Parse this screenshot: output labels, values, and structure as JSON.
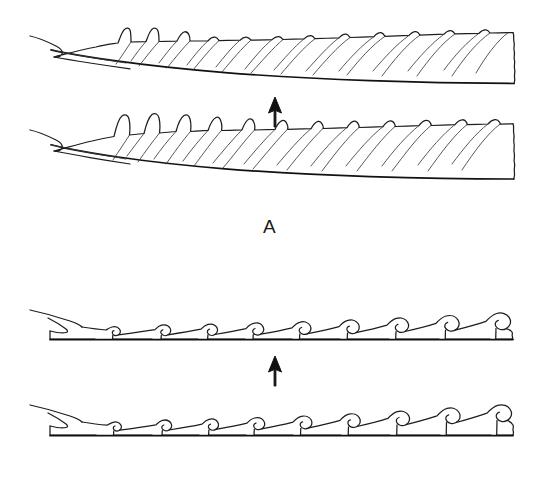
{
  "figure": {
    "kind": "scientific-line-drawing",
    "background_color": "#ffffff",
    "ink_color": "#1d1d1d",
    "panels": [
      {
        "id": "A",
        "label": "A",
        "arrow": {
          "direction": "up",
          "glyph": "arrow-up"
        },
        "specimens": [
          {
            "id": "a-upper",
            "position": "upper",
            "description": "tapering serrated blade with low broad triangular denticles and oblique ridge lines",
            "tooth_count": 20,
            "tooth_profile": "low-broad",
            "right_edge": "broken"
          },
          {
            "id": "a-lower",
            "position": "lower",
            "description": "tapering serrated blade with tall pointed denticles at the narrow end grading to low broad denticles",
            "tooth_count": 20,
            "tooth_profile": "tall-pointed",
            "right_edge": "broken"
          }
        ]
      },
      {
        "id": "B",
        "label": "B",
        "arrow": {
          "direction": "up",
          "glyph": "arrow-up"
        },
        "specimens": [
          {
            "id": "b-upper",
            "position": "upper",
            "description": "flat strip bearing a row of recurved hook-shaped denticles increasing in size toward the right",
            "hook_count": 12,
            "tooth_profile": "recurved-hook",
            "right_edge": "broken"
          },
          {
            "id": "b-lower",
            "position": "lower",
            "description": "flat strip bearing a row of recurved hook-shaped denticles increasing in size toward the right",
            "hook_count": 12,
            "tooth_profile": "recurved-hook",
            "right_edge": "broken"
          }
        ]
      }
    ]
  }
}
